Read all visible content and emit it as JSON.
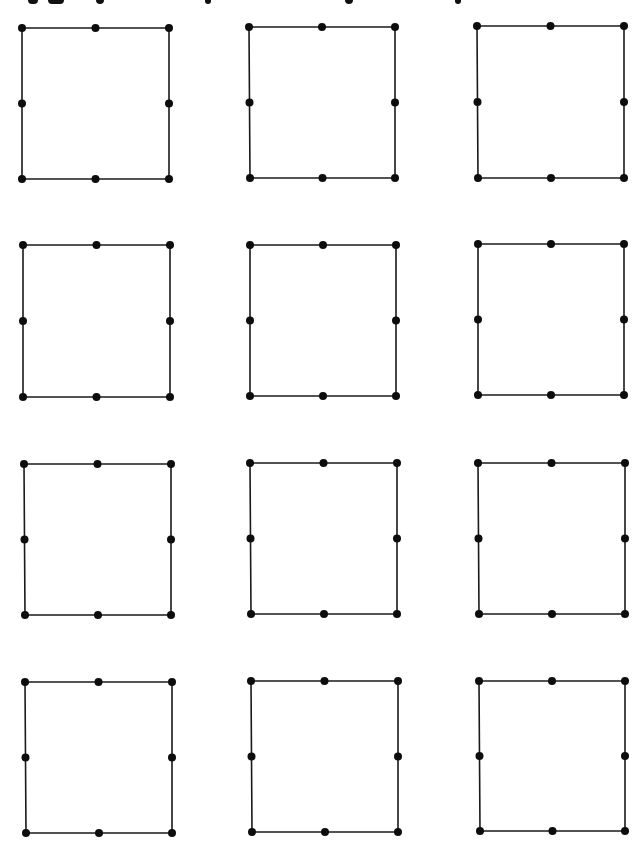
{
  "page": {
    "width": 641,
    "height": 848,
    "background": "#ffffff"
  },
  "header": {
    "title_visible": false,
    "title_note": "",
    "descender_marks": [
      {
        "x": 28,
        "w": 10
      },
      {
        "x": 48,
        "w": 16
      },
      {
        "x": 96,
        "w": 8
      },
      {
        "x": 205,
        "w": 6
      },
      {
        "x": 345,
        "w": 8
      },
      {
        "x": 455,
        "w": 6
      }
    ]
  },
  "style": {
    "line_color": "#1a1a1a",
    "dot_color": "#0d0d0d",
    "line_width": 1.6,
    "dot_radius": 4
  },
  "grid": {
    "rows": 4,
    "cols": 3,
    "squares": [
      {
        "row": 1,
        "col": 1,
        "tl": [
          22,
          28
        ],
        "tr": [
          169,
          28
        ],
        "br": [
          169,
          179
        ],
        "bl": [
          22,
          179
        ]
      },
      {
        "row": 1,
        "col": 2,
        "tl": [
          249,
          27
        ],
        "tr": [
          395,
          27
        ],
        "br": [
          395,
          178
        ],
        "bl": [
          250,
          178
        ]
      },
      {
        "row": 1,
        "col": 3,
        "tl": [
          477,
          26
        ],
        "tr": [
          624,
          26
        ],
        "br": [
          624,
          178
        ],
        "bl": [
          478,
          178
        ]
      },
      {
        "row": 2,
        "col": 1,
        "tl": [
          23,
          245
        ],
        "tr": [
          170,
          245
        ],
        "br": [
          170,
          397
        ],
        "bl": [
          23,
          397
        ]
      },
      {
        "row": 2,
        "col": 2,
        "tl": [
          250,
          245
        ],
        "tr": [
          396,
          245
        ],
        "br": [
          396,
          396
        ],
        "bl": [
          250,
          396
        ]
      },
      {
        "row": 2,
        "col": 3,
        "tl": [
          478,
          244
        ],
        "tr": [
          624,
          244
        ],
        "br": [
          624,
          395
        ],
        "bl": [
          478,
          395
        ]
      },
      {
        "row": 3,
        "col": 1,
        "tl": [
          24,
          464
        ],
        "tr": [
          171,
          464
        ],
        "br": [
          171,
          615
        ],
        "bl": [
          25,
          615
        ]
      },
      {
        "row": 3,
        "col": 2,
        "tl": [
          250,
          463
        ],
        "tr": [
          397,
          463
        ],
        "br": [
          397,
          614
        ],
        "bl": [
          251,
          614
        ]
      },
      {
        "row": 3,
        "col": 3,
        "tl": [
          478,
          463
        ],
        "tr": [
          625,
          463
        ],
        "br": [
          625,
          614
        ],
        "bl": [
          479,
          614
        ]
      },
      {
        "row": 4,
        "col": 1,
        "tl": [
          25,
          682
        ],
        "tr": [
          172,
          682
        ],
        "br": [
          172,
          833
        ],
        "bl": [
          26,
          833
        ]
      },
      {
        "row": 4,
        "col": 2,
        "tl": [
          251,
          681
        ],
        "tr": [
          398,
          681
        ],
        "br": [
          398,
          832
        ],
        "bl": [
          252,
          832
        ]
      },
      {
        "row": 4,
        "col": 3,
        "tl": [
          479,
          681
        ],
        "tr": [
          625,
          681
        ],
        "br": [
          625,
          831
        ],
        "bl": [
          480,
          831
        ]
      }
    ],
    "points_per_square": 8,
    "point_positions": [
      "top-left",
      "top-mid",
      "top-right",
      "right-mid",
      "bottom-right",
      "bottom-mid",
      "bottom-left",
      "left-mid"
    ]
  }
}
